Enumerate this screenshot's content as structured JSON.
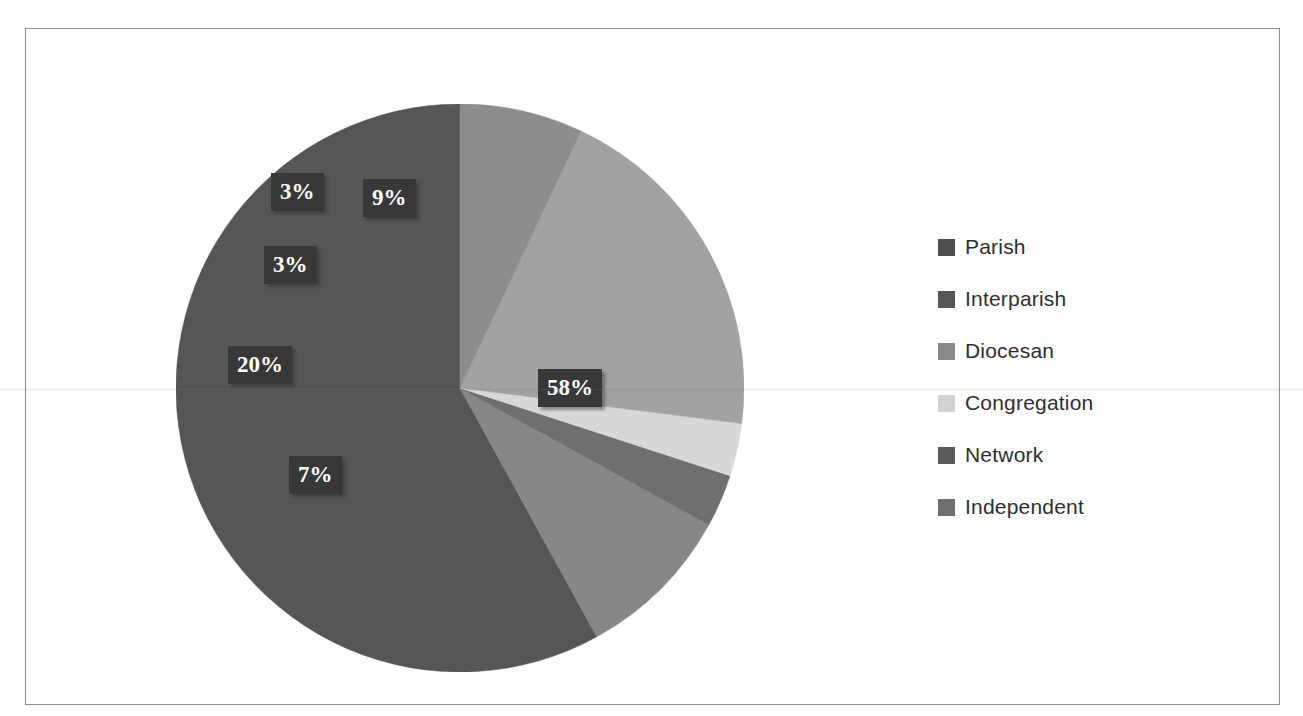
{
  "document": {
    "top_cropped_text": "",
    "frame_border_color": "#8e8e8e"
  },
  "legend": {
    "position": "right",
    "items": [
      {
        "label": "Parish",
        "color": "#4f4f4f"
      },
      {
        "label": "Interparish",
        "color": "#565656"
      },
      {
        "label": "Diocesan",
        "color": "#8a8a8a"
      },
      {
        "label": "Congregation",
        "color": "#d2d2d2"
      },
      {
        "label": "Network",
        "color": "#5a5a5a"
      },
      {
        "label": "Independent",
        "color": "#6e6e6e"
      }
    ]
  },
  "chart_data": {
    "type": "pie",
    "title": "",
    "xlabel": "",
    "ylabel": "",
    "legend_position": "right",
    "grid": false,
    "start_angle_deg": 90,
    "direction": "counterclockwise",
    "categories": [
      "Parish",
      "Interparish",
      "Diocesan",
      "Congregation",
      "Network",
      "Independent"
    ],
    "values": [
      58,
      3,
      20,
      3,
      9,
      7
    ],
    "slices": [
      {
        "label": "Parish",
        "value": 58,
        "display": "58%",
        "color": "#565656"
      },
      {
        "label": "Network",
        "value": 9,
        "display": "9%",
        "color": "#878787"
      },
      {
        "label": "Interparish",
        "value": 3,
        "display": "3%",
        "color": "#6f6f6f"
      },
      {
        "label": "Congregation",
        "value": 3,
        "display": "3%",
        "color": "#d8d8d8"
      },
      {
        "label": "Diocesan",
        "value": 20,
        "display": "20%",
        "color": "#a2a2a2"
      },
      {
        "label": "Independent",
        "value": 7,
        "display": "7%",
        "color": "#8d8d8d"
      }
    ],
    "data_labels": [
      "58%",
      "9%",
      "3%",
      "3%",
      "20%",
      "7%"
    ],
    "label_text_color": "#ffffff",
    "label_box_color": "#383838"
  }
}
